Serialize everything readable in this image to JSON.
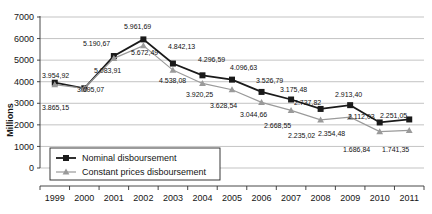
{
  "chart_data": {
    "type": "line",
    "title": "",
    "xlabel": "",
    "ylabel": "Millions",
    "categories": [
      "1999",
      "2000",
      "2001",
      "2002",
      "2003",
      "2004",
      "2005",
      "2006",
      "2007",
      "2008",
      "2009",
      "2010",
      "2011"
    ],
    "ylim": [
      0,
      7000
    ],
    "yticks": [
      0,
      1000,
      2000,
      3000,
      4000,
      5000,
      6000,
      7000
    ],
    "ytick_labels": [
      "0",
      "1000",
      "2000",
      "3000",
      "4000",
      "5000",
      "6000",
      "7000"
    ],
    "grid": true,
    "legend_position": "lower-left-inside",
    "series": [
      {
        "name": "Nominal disboursement",
        "color": "#1a1a1a",
        "marker": "square",
        "values": [
          3954.92,
          3695.07,
          5190.67,
          5961.69,
          4842.13,
          4296.59,
          4096.63,
          3526.79,
          3175.48,
          2737.82,
          2913.4,
          2112.03,
          2251.05
        ],
        "labels": [
          "3.954,92",
          "3.695,07",
          "5.190,67",
          "5.961,69",
          "4.842,13",
          "4.296,59",
          "4.096,63",
          "3.526,79",
          "3.175,48",
          "2.737,82",
          "2.913,40",
          "2.112,03",
          "2.251,05"
        ]
      },
      {
        "name": "Constant prices disboursement",
        "color": "#9a9a9a",
        "marker": "triangle",
        "values": [
          3865.15,
          3695.07,
          5083.91,
          5672.49,
          4538.08,
          3920.25,
          3628.54,
          3044.66,
          2668.55,
          2235.02,
          2354.48,
          1686.84,
          1741.35
        ],
        "labels": [
          "3.865,15",
          "3.695,07",
          "5.083,91",
          "5.672,49",
          "4.538,08",
          "3.920,25",
          "3.628,54",
          "3.044,66",
          "2.668,55",
          "2.235,02",
          "2.354,48",
          "1.686,84",
          "1.741,35"
        ]
      }
    ],
    "annotations": [
      {
        "text": "3.954,92",
        "x": 42,
        "y": 78,
        "series": "nominal",
        "category": "1999"
      },
      {
        "text": "3.865,15",
        "x": 42,
        "y": 110,
        "series": "constant",
        "category": "1999"
      },
      {
        "text": "3.695,07",
        "x": 77,
        "y": 92,
        "series": "both",
        "category": "2000"
      },
      {
        "text": "5.190,67",
        "x": 83,
        "y": 46,
        "series": "nominal",
        "category": "2001"
      },
      {
        "text": "5.083,91",
        "x": 94,
        "y": 73,
        "series": "constant",
        "category": "2001"
      },
      {
        "text": "5.961,69",
        "x": 124,
        "y": 29,
        "series": "nominal",
        "category": "2002"
      },
      {
        "text": "5.672,49",
        "x": 131,
        "y": 55,
        "series": "constant",
        "category": "2002"
      },
      {
        "text": "4.842,13",
        "x": 168,
        "y": 49,
        "series": "nominal",
        "category": "2003"
      },
      {
        "text": "4.538,08",
        "x": 159,
        "y": 83,
        "series": "constant",
        "category": "2003"
      },
      {
        "text": "4.296,59",
        "x": 198,
        "y": 62,
        "series": "nominal",
        "category": "2004"
      },
      {
        "text": "3.920,25",
        "x": 186,
        "y": 97,
        "series": "constant",
        "category": "2004"
      },
      {
        "text": "4.096,63",
        "x": 230,
        "y": 70,
        "series": "nominal",
        "category": "2005"
      },
      {
        "text": "3.628,54",
        "x": 210,
        "y": 108,
        "series": "constant",
        "category": "2005"
      },
      {
        "text": "3.526,79",
        "x": 256,
        "y": 83,
        "series": "nominal",
        "category": "2006"
      },
      {
        "text": "3.044,66",
        "x": 240,
        "y": 117,
        "series": "constant",
        "category": "2006"
      },
      {
        "text": "3.175,48",
        "x": 280,
        "y": 92,
        "series": "nominal",
        "category": "2007"
      },
      {
        "text": "2.668,55",
        "x": 264,
        "y": 128,
        "series": "constant",
        "category": "2007"
      },
      {
        "text": "2.737,82",
        "x": 294,
        "y": 105,
        "series": "nominal",
        "category": "2008"
      },
      {
        "text": "2.235,02",
        "x": 288,
        "y": 138,
        "series": "constant",
        "category": "2008"
      },
      {
        "text": "2.913,40",
        "x": 335,
        "y": 97,
        "series": "nominal",
        "category": "2009"
      },
      {
        "text": "2.354,48",
        "x": 318,
        "y": 136,
        "series": "constant",
        "category": "2009"
      },
      {
        "text": "2.112,03",
        "x": 348,
        "y": 119,
        "series": "nominal",
        "category": "2010"
      },
      {
        "text": "1.686,84",
        "x": 343,
        "y": 152,
        "series": "constant",
        "category": "2010"
      },
      {
        "text": "2.251,05",
        "x": 380,
        "y": 118,
        "series": "nominal",
        "category": "2011"
      },
      {
        "text": "1.741,35",
        "x": 382,
        "y": 152,
        "series": "constant",
        "category": "2011"
      }
    ]
  }
}
